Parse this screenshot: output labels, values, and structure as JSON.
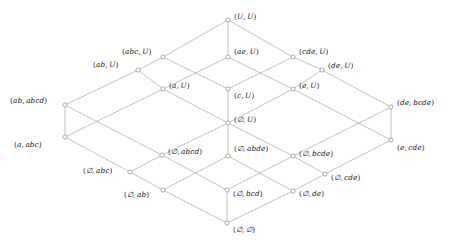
{
  "diagram": {
    "type": "lattice-hasse-diagram",
    "colors": {
      "edge": "#9a9a9a",
      "node_stroke": "#8a8a8a",
      "node_fill": "#ffffff",
      "label_text": "#1a1a1a",
      "background": "#ffffff"
    },
    "nodes": [
      {
        "id": "n_UU",
        "label": "(U, U)",
        "x": 228,
        "y": 20,
        "lx": 234,
        "ly": 13
      },
      {
        "id": "n_abcU",
        "label": "(abc, U)",
        "x": 163,
        "y": 57,
        "lx": 122,
        "ly": 48
      },
      {
        "id": "n_aeU",
        "label": "(ae, U)",
        "x": 228,
        "y": 57,
        "lx": 234,
        "ly": 48
      },
      {
        "id": "n_cdeU",
        "label": "(cde, U)",
        "x": 293,
        "y": 57,
        "lx": 299,
        "ly": 48
      },
      {
        "id": "n_abU",
        "label": "(ab, U)",
        "x": 138,
        "y": 70,
        "lx": 93,
        "ly": 61
      },
      {
        "id": "n_deU",
        "label": "(de, U)",
        "x": 322,
        "y": 70,
        "lx": 328,
        "ly": 62
      },
      {
        "id": "n_aU",
        "label": "(a, U)",
        "x": 163,
        "y": 89,
        "lx": 169,
        "ly": 82
      },
      {
        "id": "n_cU",
        "label": "(c, U)",
        "x": 228,
        "y": 89,
        "lx": 234,
        "ly": 92
      },
      {
        "id": "n_eU",
        "label": "(e, U)",
        "x": 293,
        "y": 89,
        "lx": 299,
        "ly": 82
      },
      {
        "id": "n_ababcd",
        "label": "(ab, abcd)",
        "x": 65,
        "y": 105,
        "lx": 10,
        "ly": 97
      },
      {
        "id": "n_debcde",
        "label": "(de, bcde)",
        "x": 391,
        "y": 107,
        "lx": 397,
        "ly": 99
      },
      {
        "id": "n_emptyU",
        "label": "(∅, U)",
        "x": 228,
        "y": 123,
        "lx": 234,
        "ly": 116
      },
      {
        "id": "n_aabc",
        "label": "(a, abc)",
        "x": 65,
        "y": 137,
        "lx": 14,
        "ly": 141
      },
      {
        "id": "n_ecde",
        "label": "(e, cde)",
        "x": 391,
        "y": 140,
        "lx": 397,
        "ly": 144
      },
      {
        "id": "n_emptyabcd",
        "label": "(∅, abcd)",
        "x": 162,
        "y": 155,
        "lx": 168,
        "ly": 148
      },
      {
        "id": "n_emptyabde",
        "label": "(∅, abde)",
        "x": 228,
        "y": 156,
        "lx": 234,
        "ly": 145
      },
      {
        "id": "n_emptybcde",
        "label": "(∅, bcde)",
        "x": 293,
        "y": 156,
        "lx": 299,
        "ly": 150
      },
      {
        "id": "n_emptyabc",
        "label": "(∅, abc)",
        "x": 130,
        "y": 172,
        "lx": 83,
        "ly": 167
      },
      {
        "id": "n_emptycde",
        "label": "(∅, cde)",
        "x": 325,
        "y": 174,
        "lx": 331,
        "ly": 174
      },
      {
        "id": "n_emptyab",
        "label": "(∅, ab)",
        "x": 163,
        "y": 190,
        "lx": 124,
        "ly": 191
      },
      {
        "id": "n_emptybcd",
        "label": "(∅, bcd)",
        "x": 227,
        "y": 190,
        "lx": 233,
        "ly": 190
      },
      {
        "id": "n_emptyde",
        "label": "(∅, de)",
        "x": 293,
        "y": 191,
        "lx": 299,
        "ly": 190
      },
      {
        "id": "n_emptyempty",
        "label": "(∅, ∅)",
        "x": 227,
        "y": 223,
        "lx": 233,
        "ly": 226
      }
    ],
    "edges": [
      [
        "n_UU",
        "n_abcU"
      ],
      [
        "n_UU",
        "n_aeU"
      ],
      [
        "n_UU",
        "n_cdeU"
      ],
      [
        "n_abcU",
        "n_abU"
      ],
      [
        "n_abcU",
        "n_cU"
      ],
      [
        "n_aeU",
        "n_aU"
      ],
      [
        "n_aeU",
        "n_eU"
      ],
      [
        "n_cdeU",
        "n_cU"
      ],
      [
        "n_cdeU",
        "n_deU"
      ],
      [
        "n_abU",
        "n_ababcd"
      ],
      [
        "n_abU",
        "n_aU"
      ],
      [
        "n_deU",
        "n_eU"
      ],
      [
        "n_deU",
        "n_debcde"
      ],
      [
        "n_aU",
        "n_emptyU"
      ],
      [
        "n_aU",
        "n_aabc"
      ],
      [
        "n_cU",
        "n_emptyU"
      ],
      [
        "n_eU",
        "n_emptyU"
      ],
      [
        "n_eU",
        "n_ecde"
      ],
      [
        "n_ababcd",
        "n_aabc"
      ],
      [
        "n_ababcd",
        "n_emptyabcd"
      ],
      [
        "n_debcde",
        "n_ecde"
      ],
      [
        "n_debcde",
        "n_emptybcde"
      ],
      [
        "n_emptyU",
        "n_emptyabcd"
      ],
      [
        "n_emptyU",
        "n_emptyabde"
      ],
      [
        "n_emptyU",
        "n_emptybcde"
      ],
      [
        "n_aabc",
        "n_emptyabc"
      ],
      [
        "n_ecde",
        "n_emptycde"
      ],
      [
        "n_emptyabcd",
        "n_emptyabc"
      ],
      [
        "n_emptyabcd",
        "n_emptybcd"
      ],
      [
        "n_emptyabde",
        "n_emptyab"
      ],
      [
        "n_emptyabde",
        "n_emptyde"
      ],
      [
        "n_emptybcde",
        "n_emptybcd"
      ],
      [
        "n_emptybcde",
        "n_emptycde"
      ],
      [
        "n_emptyabc",
        "n_emptyab"
      ],
      [
        "n_emptycde",
        "n_emptyde"
      ],
      [
        "n_emptyab",
        "n_emptyempty"
      ],
      [
        "n_emptybcd",
        "n_emptyempty"
      ],
      [
        "n_emptyde",
        "n_emptyempty"
      ]
    ]
  }
}
